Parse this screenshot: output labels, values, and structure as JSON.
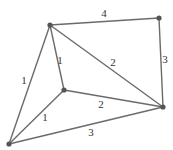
{
  "graph": {
    "type": "weighted-undirected-graph",
    "nodes": [
      {
        "id": "A",
        "x": 50,
        "y": 25
      },
      {
        "id": "B",
        "x": 159,
        "y": 18
      },
      {
        "id": "C",
        "x": 163,
        "y": 107
      },
      {
        "id": "D",
        "x": 64,
        "y": 90
      },
      {
        "id": "E",
        "x": 9,
        "y": 144
      }
    ],
    "edges": [
      {
        "from": "A",
        "to": "B",
        "weight": "4",
        "label_x": 104,
        "label_y": 17
      },
      {
        "from": "B",
        "to": "C",
        "weight": "3",
        "label_x": 165,
        "label_y": 63
      },
      {
        "from": "A",
        "to": "C",
        "weight": "2",
        "label_x": 113,
        "label_y": 66
      },
      {
        "from": "A",
        "to": "D",
        "weight": "1",
        "label_x": 60,
        "label_y": 64
      },
      {
        "from": "A",
        "to": "E",
        "weight": "1",
        "label_x": 24,
        "label_y": 84
      },
      {
        "from": "D",
        "to": "C",
        "weight": "2",
        "label_x": 101,
        "label_y": 108
      },
      {
        "from": "D",
        "to": "E",
        "weight": "1",
        "label_x": 45,
        "label_y": 121
      },
      {
        "from": "E",
        "to": "C",
        "weight": "3",
        "label_x": 91,
        "label_y": 136
      }
    ]
  },
  "colors": {
    "edge": "#6b6b6b",
    "node": "#555555",
    "label": "#333333",
    "background": "#ffffff"
  }
}
